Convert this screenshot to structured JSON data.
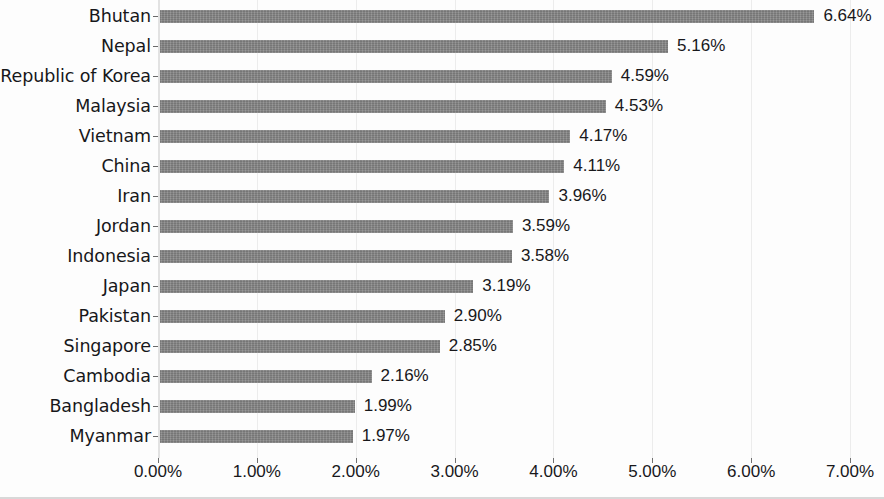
{
  "chart_data": {
    "type": "bar",
    "orientation": "horizontal",
    "title": "",
    "subtitle": "",
    "xlabel": "",
    "ylabel": "",
    "xlim": [
      0,
      7
    ],
    "xtick_labels": [
      "0.00%",
      "1.00%",
      "2.00%",
      "3.00%",
      "4.00%",
      "5.00%",
      "6.00%",
      "7.00%"
    ],
    "xtick_values": [
      0,
      1,
      2,
      3,
      4,
      5,
      6,
      7
    ],
    "grid": true,
    "legend": false,
    "bar_color": "#828282",
    "categories": [
      "Bhutan",
      "Nepal",
      "Republic of Korea",
      "Malaysia",
      "Vietnam",
      "China",
      "Iran",
      "Jordan",
      "Indonesia",
      "Japan",
      "Pakistan",
      "Singapore",
      "Cambodia",
      "Bangladesh",
      "Myanmar"
    ],
    "values": [
      6.64,
      5.16,
      4.59,
      4.53,
      4.17,
      4.11,
      3.96,
      3.59,
      3.58,
      3.19,
      2.9,
      2.85,
      2.16,
      1.99,
      1.97
    ],
    "data_labels": [
      "6.64%",
      "5.16%",
      "4.59%",
      "4.53%",
      "4.17%",
      "4.11%",
      "3.96%",
      "3.59%",
      "3.58%",
      "3.19%",
      "2.90%",
      "2.85%",
      "2.16%",
      "1.99%",
      "1.97%"
    ]
  }
}
